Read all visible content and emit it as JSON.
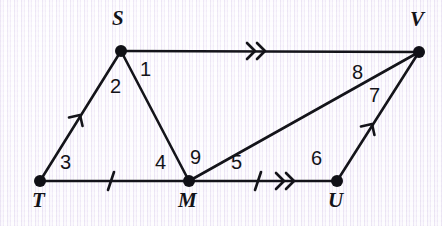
{
  "figure": {
    "stroke_color": "#14141a",
    "background_color": "#f3eff9",
    "vertices": [
      {
        "id": "S",
        "label": "S",
        "x": 121,
        "y": 51,
        "label_x": 112,
        "label_y": 8
      },
      {
        "id": "V",
        "label": "V",
        "x": 419,
        "y": 52,
        "label_x": 410,
        "label_y": 9
      },
      {
        "id": "T",
        "label": "T",
        "x": 40,
        "y": 181,
        "label_x": 32,
        "label_y": 190
      },
      {
        "id": "M",
        "label": "M",
        "x": 189,
        "y": 181,
        "label_x": 178,
        "label_y": 190
      },
      {
        "id": "U",
        "label": "U",
        "x": 337,
        "y": 181,
        "label_x": 328,
        "label_y": 190
      }
    ],
    "segments": [
      {
        "id": "TS",
        "from": "T",
        "to": "S",
        "marker": "single-arrow"
      },
      {
        "id": "SV",
        "from": "S",
        "to": "V",
        "marker": "double-arrow"
      },
      {
        "id": "SM",
        "from": "S",
        "to": "M",
        "marker": "none"
      },
      {
        "id": "TM",
        "from": "T",
        "to": "M",
        "marker": "tick"
      },
      {
        "id": "MU",
        "from": "M",
        "to": "U",
        "marker": "tick-and-double-arrow"
      },
      {
        "id": "MV",
        "from": "M",
        "to": "V",
        "marker": "none"
      },
      {
        "id": "UV",
        "from": "U",
        "to": "V",
        "marker": "single-arrow"
      }
    ],
    "angle_labels": [
      {
        "id": "angle-1",
        "label": "1",
        "x": 140,
        "y": 59
      },
      {
        "id": "angle-2",
        "label": "2",
        "x": 110,
        "y": 76
      },
      {
        "id": "angle-3",
        "label": "3",
        "x": 60,
        "y": 152
      },
      {
        "id": "angle-4",
        "label": "4",
        "x": 155,
        "y": 152
      },
      {
        "id": "angle-5",
        "label": "5",
        "x": 231,
        "y": 152
      },
      {
        "id": "angle-6",
        "label": "6",
        "x": 311,
        "y": 148
      },
      {
        "id": "angle-7",
        "label": "7",
        "x": 369,
        "y": 85
      },
      {
        "id": "angle-8",
        "label": "8",
        "x": 352,
        "y": 62
      },
      {
        "id": "angle-9",
        "label": "9",
        "x": 190,
        "y": 147
      }
    ]
  }
}
